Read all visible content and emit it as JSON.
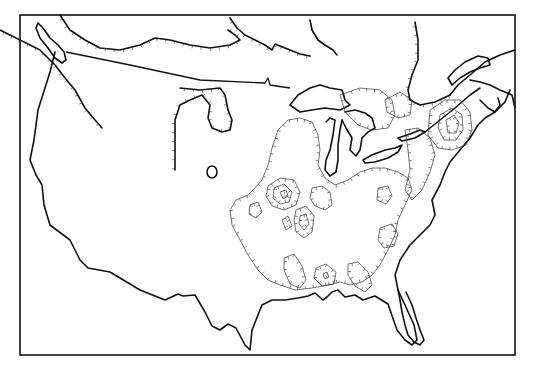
{
  "map": {
    "type": "isoline map",
    "region": "Conterminous United States and southern Canada",
    "style": "black and white line drawing",
    "colors": {
      "background": "#ffffff",
      "coastline": "#111111",
      "contour": "#333333"
    },
    "layers": [
      {
        "name": "frame",
        "description": "rectangular neat line"
      },
      {
        "name": "coastline",
        "description": "continental coastline, Great Lakes, Hudson Bay shore, Gulf of St. Lawrence"
      },
      {
        "name": "international-border",
        "description": "US–Canada border along 49th parallel"
      },
      {
        "name": "hachured-contours",
        "description": "closed isolines with tick marks, concentrated over eastern and central US"
      }
    ],
    "labels": []
  }
}
